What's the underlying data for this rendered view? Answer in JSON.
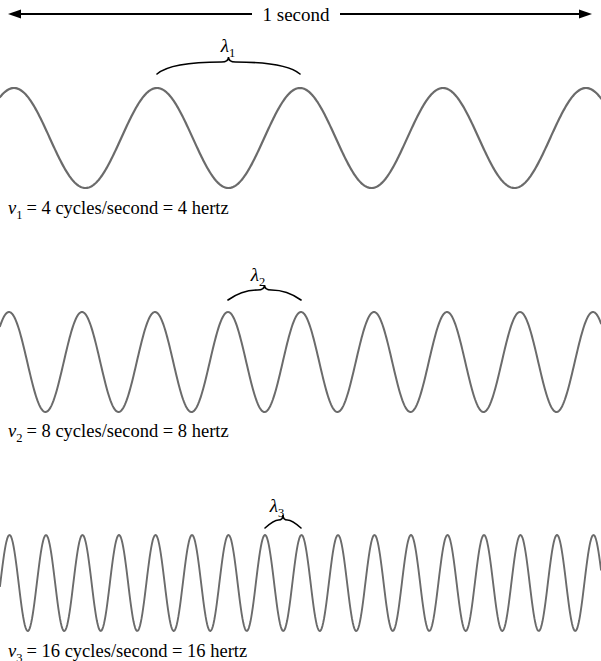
{
  "figure": {
    "width": 601,
    "height": 661,
    "background": "#ffffff",
    "wave_color": "#6b6b6b",
    "ink_color": "#000000",
    "timeline": {
      "label": "1 second",
      "arrow_name": "double-headed-arrow",
      "x_start": 8,
      "x_end": 592,
      "y": 14,
      "text_gap_left": 252,
      "text_gap_right": 340
    }
  },
  "chart_data": {
    "type": "line",
    "title": "1 second",
    "xlabel": "",
    "ylabel": "",
    "grid": false,
    "legend": "none",
    "x_range_seconds": [
      0,
      1
    ],
    "series": [
      {
        "name": "wave-1",
        "frequency_hz": 4,
        "cycles_per_second": 4,
        "wavelength_symbol": "λ",
        "wavelength_subscript": "1",
        "frequency_symbol": "ν",
        "frequency_subscript": "1",
        "label": "= 4 cycles/second = 4 hertz",
        "peaks": 4,
        "baseline_y": 138,
        "amplitude": 50,
        "top_y": 88,
        "bottom_y": 188,
        "phase_peak_x": 157,
        "wavelength_px": 143,
        "stroke_width": 2.2,
        "label_x": 8,
        "label_y": 214,
        "brace": {
          "x_left": 157,
          "x_right": 300,
          "y_bottom": 74,
          "y_top": 62,
          "label_x": 228,
          "label_y": 52
        }
      },
      {
        "name": "wave-2",
        "frequency_hz": 8,
        "cycles_per_second": 8,
        "wavelength_symbol": "λ",
        "wavelength_subscript": "2",
        "frequency_symbol": "ν",
        "frequency_subscript": "2",
        "label": "= 8 cycles/second = 8 hertz",
        "peaks": 8,
        "baseline_y": 362,
        "amplitude": 50,
        "top_y": 312,
        "bottom_y": 412,
        "phase_peak_x": 228,
        "wavelength_px": 73,
        "stroke_width": 2.0,
        "label_x": 8,
        "label_y": 437,
        "brace": {
          "x_left": 228,
          "x_right": 301,
          "y_bottom": 300,
          "y_top": 290,
          "label_x": 258,
          "label_y": 281
        }
      },
      {
        "name": "wave-3",
        "frequency_hz": 16,
        "cycles_per_second": 16,
        "wavelength_symbol": "λ",
        "wavelength_subscript": "3",
        "frequency_symbol": "ν",
        "frequency_subscript": "3",
        "label": "= 16 cycles/second = 16 hertz",
        "peaks": 16,
        "baseline_y": 583,
        "amplitude": 48,
        "top_y": 535,
        "bottom_y": 631,
        "phase_peak_x": 265,
        "wavelength_px": 36.5,
        "stroke_width": 1.9,
        "label_x": 8,
        "label_y": 657,
        "brace": {
          "x_left": 265,
          "x_right": 301,
          "y_bottom": 528,
          "y_top": 520,
          "label_x": 277,
          "label_y": 512
        }
      }
    ]
  }
}
